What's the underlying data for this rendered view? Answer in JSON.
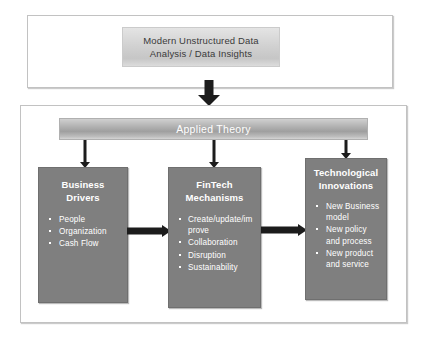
{
  "diagram": {
    "title_box": {
      "line1": "Modern Unstructured Data",
      "line2": "Analysis / Data Insights"
    },
    "applied_theory": {
      "label": "Applied Theory"
    },
    "boxes": [
      {
        "id": "business-drivers",
        "title_line1": "Business",
        "title_line2": "Drivers",
        "items": [
          "People",
          "Organization",
          "Cash Flow"
        ]
      },
      {
        "id": "fintech-mechanisms",
        "title_line1": "FinTech",
        "title_line2": "Mechanisms",
        "items": [
          "Create/update/improve",
          "Collaboration",
          "Disruption",
          "Sustainability"
        ]
      },
      {
        "id": "technological-innovations",
        "title_line1": "Technological",
        "title_line2": "Innovations",
        "items": [
          "New Business model",
          "New policy and process",
          "New product and service"
        ]
      }
    ],
    "connectors": [
      {
        "name": "title-to-framework",
        "direction": "down"
      },
      {
        "name": "theory-to-business-drivers",
        "direction": "down"
      },
      {
        "name": "theory-to-fintech-mechanisms",
        "direction": "down"
      },
      {
        "name": "theory-to-technological-innovations",
        "direction": "down"
      },
      {
        "name": "business-drivers-to-fintech-mechanisms",
        "direction": "right"
      },
      {
        "name": "fintech-mechanisms-to-technological-innovations",
        "direction": "right"
      }
    ],
    "colors": {
      "box_fill": "#7f7f7f",
      "box_text": "#ffffff",
      "bar_text": "#ffffff",
      "frame_border": "#c2c2c2",
      "arrow": "#1c1c1c",
      "title_text": "#3a3a3a",
      "background": "#ffffff"
    }
  }
}
